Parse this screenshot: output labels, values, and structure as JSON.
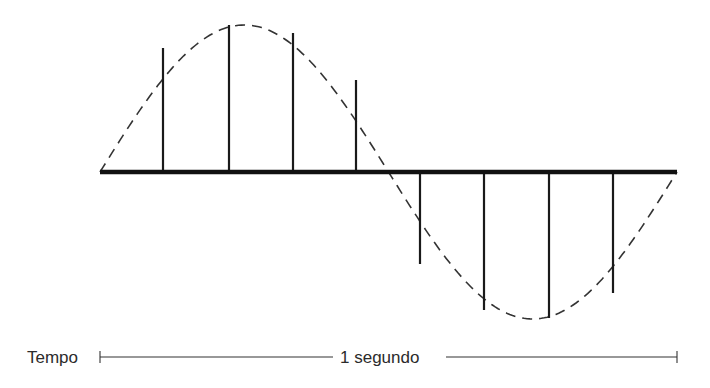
{
  "diagram": {
    "colors": {
      "stroke": "#1a1a1a",
      "envelope": "#333333",
      "text": "#2b2b2b",
      "background": "#ffffff"
    },
    "baseline": {
      "x_start": 100,
      "x_end": 677,
      "y": 172
    },
    "envelope": {
      "style": "dashed",
      "shape": "sine",
      "period_px": 577,
      "amplitude_px": 147
    },
    "samples": [
      {
        "x": 163,
        "top": 48,
        "bottom": 172,
        "direction": "positive"
      },
      {
        "x": 229,
        "top": 25,
        "bottom": 172,
        "direction": "positive"
      },
      {
        "x": 293,
        "top": 33,
        "bottom": 172,
        "direction": "positive"
      },
      {
        "x": 356,
        "top": 80,
        "bottom": 172,
        "direction": "positive"
      },
      {
        "x": 420,
        "top": 172,
        "bottom": 264,
        "direction": "negative"
      },
      {
        "x": 484,
        "top": 172,
        "bottom": 310,
        "direction": "negative"
      },
      {
        "x": 549,
        "top": 172,
        "bottom": 318,
        "direction": "negative"
      },
      {
        "x": 613,
        "top": 172,
        "bottom": 293,
        "direction": "negative"
      }
    ],
    "time_axis": {
      "label": "Tempo",
      "span_label": "1 segundo",
      "x_start": 100,
      "x_end": 677,
      "y": 357
    }
  }
}
